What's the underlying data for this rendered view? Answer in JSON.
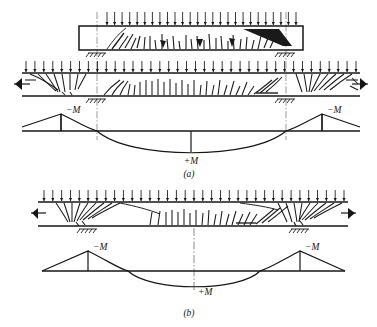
{
  "figure": {
    "panels": [
      {
        "key": "a",
        "caption": "(a)",
        "caption_x": 189,
        "caption_y": 168,
        "description": "Two-span continuous beam with uniform load; cracked beam elevations above and bending moment diagram below",
        "views": [
          {
            "name": "beam-elevation-top",
            "type": "beam-box",
            "x": 79,
            "y": 26,
            "w": 224,
            "h": 24,
            "load": {
              "type": "uniform-distributed-downward",
              "arrow_count": 26,
              "x1": 107,
              "x2": 296,
              "y_top": 12,
              "y_bottom": 25
            },
            "supports": [
              {
                "name": "interior-support-left",
                "x": 97,
                "y": 50,
                "type": "hatched-ground"
              },
              {
                "name": "interior-support-right",
                "x": 286,
                "y": 50,
                "type": "hatched-ground"
              }
            ]
          },
          {
            "name": "beam-elevation-middle",
            "type": "beam-open-ends",
            "x1": 22,
            "x2": 360,
            "y_top": 73,
            "y_bottom": 96,
            "load": {
              "type": "uniform-distributed-downward",
              "arrow_count": 38,
              "x1": 26,
              "x2": 356,
              "y_top": 61,
              "y_bottom": 72
            },
            "supports": [
              {
                "name": "interior-support-left",
                "x": 97,
                "y": 96,
                "type": "hatched-ground"
              },
              {
                "name": "interior-support-right",
                "x": 286,
                "y": 96,
                "type": "hatched-ground"
              }
            ],
            "end_marks": [
              {
                "name": "cut-break-left",
                "x": 22,
                "y": 84
              },
              {
                "name": "cut-break-right",
                "x": 360,
                "y": 84
              }
            ]
          },
          {
            "name": "moment-diagram",
            "type": "bending-moment",
            "baseline_y": 131,
            "x_left": 22,
            "x_right": 360,
            "support_left_x": 97,
            "support_right_x": 286,
            "negative_peak": -17,
            "positive_peak": 22,
            "midspan_x": 191,
            "labels": [
              {
                "text": "−M",
                "x": 104,
                "y": 112,
                "name": "negative-moment-label-left"
              },
              {
                "text": "−M",
                "x": 292,
                "y": 112,
                "name": "negative-moment-label-right"
              },
              {
                "text": "+M",
                "x": 191,
                "y": 162,
                "name": "positive-moment-label"
              }
            ]
          }
        ],
        "reference_lines": [
          {
            "name": "support-line-left",
            "x": 97,
            "y1": 12,
            "y2": 140,
            "style": "dash-dot"
          },
          {
            "name": "support-line-right",
            "x": 286,
            "y1": 12,
            "y2": 140,
            "style": "dash-dot"
          }
        ]
      },
      {
        "key": "b",
        "caption": "(b)",
        "caption_x": 189,
        "caption_y": 313,
        "description": "Fixed-end single span beam with uniform load; cracked beam elevation above and bending moment diagram below",
        "views": [
          {
            "name": "beam-elevation",
            "type": "beam-open-ends",
            "x1": 38,
            "x2": 348,
            "y_top": 202,
            "y_bottom": 226,
            "load": {
              "type": "uniform-distributed-downward",
              "arrow_count": 35,
              "x1": 44,
              "x2": 344,
              "y_top": 190,
              "y_bottom": 201
            },
            "supports": [
              {
                "name": "support-left",
                "x": 88,
                "y": 226,
                "type": "hatched-ground"
              },
              {
                "name": "support-right",
                "x": 300,
                "y": 226,
                "type": "hatched-ground"
              }
            ],
            "end_marks": [
              {
                "name": "cut-break-left",
                "x": 38,
                "y": 214
              },
              {
                "name": "cut-break-right",
                "x": 348,
                "y": 214
              }
            ]
          },
          {
            "name": "moment-diagram",
            "type": "bending-moment",
            "baseline_y": 271,
            "x_left": 42,
            "x_right": 345,
            "support_left_x": 88,
            "support_right_x": 300,
            "negative_peak": -20,
            "positive_peak": 17,
            "midspan_x": 194,
            "labels": [
              {
                "text": "−M",
                "x": 96,
                "y": 249,
                "name": "negative-moment-label-left"
              },
              {
                "text": "−M",
                "x": 307,
                "y": 249,
                "name": "negative-moment-label-right"
              },
              {
                "text": "+M",
                "x": 200,
                "y": 292,
                "name": "positive-moment-label"
              }
            ]
          }
        ],
        "reference_lines": [
          {
            "name": "centerline",
            "x": 194,
            "y1": 226,
            "y2": 292,
            "style": "dash-dot"
          }
        ]
      }
    ]
  },
  "symbols": {
    "load_arrow": "downward-arrow",
    "support": "hatched-ground-symbol",
    "centerline": "dash-dot-line"
  },
  "colors": {
    "ink": "#161616",
    "background": "#ffffff",
    "crack": "#1a1a1a"
  }
}
